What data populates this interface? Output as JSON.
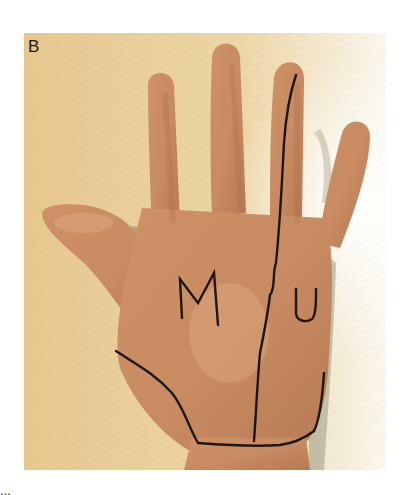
{
  "figure": {
    "panel_label": "B",
    "annotations": {
      "left_region_letter": "M",
      "right_region_letter": "U"
    },
    "caption_fragment": "...",
    "colors": {
      "background_wood": "#e6cc97",
      "background_glare": "#fbf8ef",
      "skin": "#c98a5e",
      "skin_light": "#d9a27a",
      "skin_shadow": "#a8684a",
      "marker_line": "#1e1612",
      "shadow_gray": "#9c9a86"
    }
  }
}
